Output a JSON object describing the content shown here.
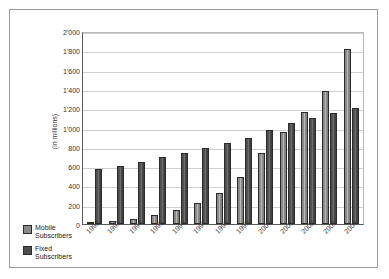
{
  "chart_data": {
    "type": "bar",
    "title": "",
    "xlabel": "",
    "ylabel": "(in millions)",
    "ylim": [
      0,
      2000
    ],
    "ytick_step": 200,
    "ytick_labels": [
      "2'000",
      "1'800",
      "1'600",
      "1'400",
      "1'200",
      "1'000",
      "800",
      "600",
      "400",
      "200",
      "0"
    ],
    "ytick_values": [
      2000,
      1800,
      1600,
      1400,
      1200,
      1000,
      800,
      600,
      400,
      200,
      0
    ],
    "grid": true,
    "legend_position": "bottom-left",
    "categories": [
      "1992",
      "1993",
      "1994",
      "1995",
      "1996",
      "1997",
      "1998",
      "1999",
      "2000",
      "2001",
      "2002",
      "2003",
      "2004"
    ],
    "series": [
      {
        "name": "Mobile Subscribers",
        "color": "#8a8a8a",
        "values": [
          23,
          34,
          56,
          91,
          145,
          215,
          318,
          490,
          740,
          955,
          1160,
          1375,
          1810
        ]
      },
      {
        "name": "Fixed Subscribers",
        "color": "#4e4e4e",
        "values": [
          575,
          605,
          645,
          690,
          740,
          790,
          840,
          890,
          975,
          1050,
          1095,
          1150,
          1205
        ]
      }
    ]
  },
  "legend": {
    "items": [
      {
        "label_line1": "Mobile",
        "label_line2": "Subscribers",
        "swatch": "mobile-swatch"
      },
      {
        "label_line1": "Fixed",
        "label_line2": "Subscribers",
        "swatch": "fixed-swatch"
      }
    ]
  }
}
